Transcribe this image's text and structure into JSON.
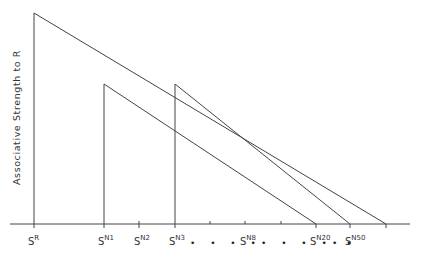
{
  "diagram": {
    "y_axis_label": "Associative Strength to R",
    "x_labels": [
      {
        "base": "S",
        "sup": "R",
        "x": 34
      },
      {
        "base": "S",
        "sup": "N1",
        "x": 104
      },
      {
        "base": "S",
        "sup": "N2",
        "x": 139
      },
      {
        "base": "S",
        "sup": "N3",
        "x": 175
      },
      {
        "base": "S",
        "sup": "N8",
        "x": 245
      },
      {
        "base": "S",
        "sup": "N20",
        "x": 316
      },
      {
        "base": "S",
        "sup": "N50",
        "x": 350
      }
    ],
    "ellipsis": "• • • •",
    "curves": [
      {
        "name": "S^R strength",
        "start_x": 34,
        "peak_y": 13,
        "end_x": 386
      },
      {
        "name": "S^N1 strength",
        "start_x": 104,
        "peak_y": 84,
        "end_x": 316
      },
      {
        "name": "S^N3 strength",
        "start_x": 175,
        "peak_y": 84,
        "end_x": 350
      }
    ],
    "baseline_y": 224
  }
}
